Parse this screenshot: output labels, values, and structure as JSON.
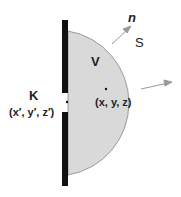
{
  "labels": {
    "normal": "n",
    "surface": "S",
    "volume": "V",
    "point_k": "K",
    "point_k_coords": "(x′, y′, z′)",
    "point_xyz": "(x, y, z)"
  },
  "colors": {
    "fill": "#d9d9d9",
    "outline": "#888888",
    "wall": "#111111",
    "arrow": "#999999"
  }
}
